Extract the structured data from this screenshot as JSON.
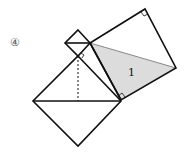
{
  "figure": {
    "label": "④",
    "region_label": "1",
    "shaded_color": "#dcdcdc",
    "stroke_color": "#111111"
  }
}
